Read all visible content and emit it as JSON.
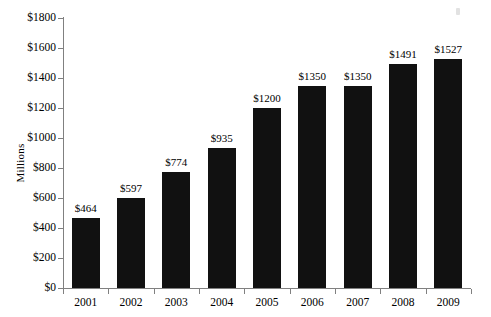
{
  "chart_data": {
    "type": "bar",
    "title": "",
    "xlabel": "",
    "ylabel": "Millions",
    "categories": [
      "2001",
      "2002",
      "2003",
      "2004",
      "2005",
      "2006",
      "2007",
      "2008",
      "2009"
    ],
    "values": [
      464,
      597,
      774,
      935,
      1200,
      1350,
      1350,
      1491,
      1527
    ],
    "value_labels": [
      "$464",
      "$597",
      "$774",
      "$935",
      "$1200",
      "$1350",
      "$1350",
      "$1491",
      "$1527"
    ],
    "ylim": [
      0,
      1800
    ],
    "ytick_values": [
      0,
      200,
      400,
      600,
      800,
      1000,
      1200,
      1400,
      1600,
      1800
    ],
    "ytick_labels": [
      "$0",
      "$200",
      "$400",
      "$600",
      "$800",
      "$1000",
      "$1200",
      "$1400",
      "$1600",
      "$1800"
    ],
    "grid": false,
    "legend": "none",
    "bar_color": "#111111",
    "axis_color": "#808080",
    "background": "#ffffff"
  }
}
